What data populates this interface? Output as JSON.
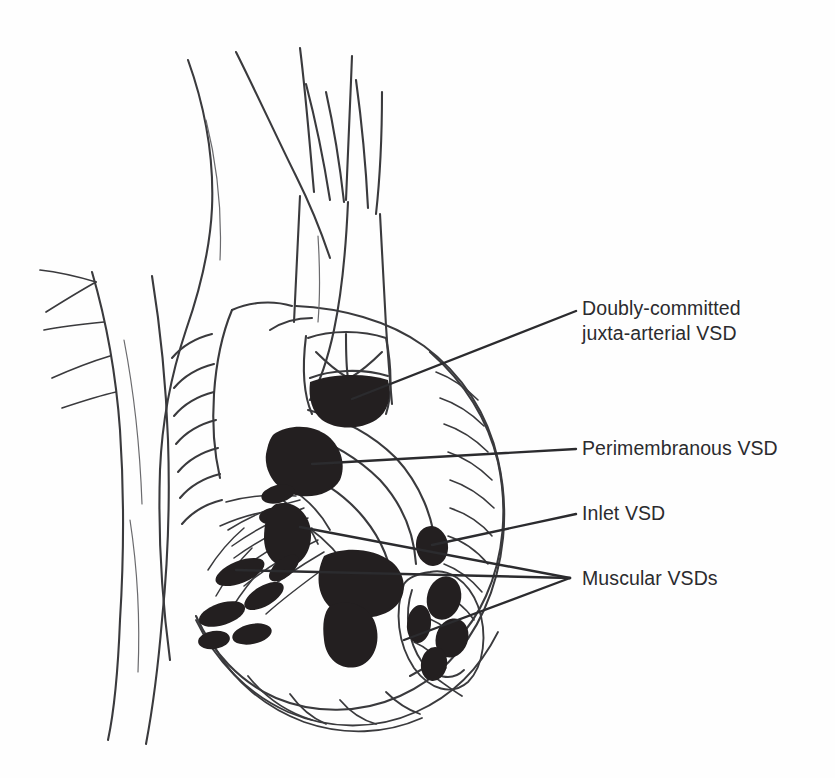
{
  "figure": {
    "background_color": "#fefefe",
    "ink_color": "#2b2b2e",
    "defect_fill_color": "#231f20",
    "width": 835,
    "height": 778
  },
  "labels": {
    "doubly_committed": {
      "line1": "Doubly-committed",
      "line2": "juxta-arterial VSD"
    },
    "perimembranous": "Perimembranous VSD",
    "inlet": "Inlet VSD",
    "muscular": "Muscular VSDs"
  },
  "leader_lines": [
    {
      "name": "doubly-committed-leader",
      "from_x": 576,
      "from_y": 311,
      "to_x": 352,
      "to_y": 399
    },
    {
      "name": "perimembranous-leader",
      "from_x": 576,
      "from_y": 449,
      "to_x": 312,
      "to_y": 464
    },
    {
      "name": "inlet-leader",
      "from_x": 576,
      "from_y": 514,
      "to_x": 432,
      "to_y": 545
    },
    {
      "name": "muscular-leader-upper",
      "from_x": 570,
      "from_y": 578,
      "to_x": 300,
      "to_y": 527
    },
    {
      "name": "muscular-leader-middle",
      "from_x": 570,
      "from_y": 578,
      "to_x": 236,
      "to_y": 570
    },
    {
      "name": "muscular-leader-lower",
      "from_x": 570,
      "from_y": 578,
      "to_x": 404,
      "to_y": 640
    }
  ],
  "structures": [
    {
      "name": "aortic-arch",
      "kind": "vessel"
    },
    {
      "name": "brachiocephalic-artery",
      "kind": "vessel"
    },
    {
      "name": "left-common-carotid-artery",
      "kind": "vessel"
    },
    {
      "name": "left-subclavian-artery",
      "kind": "vessel"
    },
    {
      "name": "descending-aorta",
      "kind": "vessel"
    },
    {
      "name": "intercostal-branches",
      "kind": "vessel"
    },
    {
      "name": "pulmonary-trunk",
      "kind": "vessel"
    },
    {
      "name": "right-atrium",
      "kind": "chamber"
    },
    {
      "name": "right-ventricle",
      "kind": "chamber"
    },
    {
      "name": "ventricular-septum",
      "kind": "septum"
    },
    {
      "name": "semilunar-valve-cusps",
      "kind": "valve"
    },
    {
      "name": "tricuspid-valve-leaflets",
      "kind": "valve"
    },
    {
      "name": "chordae-tendineae",
      "kind": "valve-apparatus"
    },
    {
      "name": "trabeculated-myocardium",
      "kind": "muscle"
    },
    {
      "name": "ventricular-apex",
      "kind": "muscle"
    }
  ],
  "defects": [
    {
      "name": "defect-doubly-committed-juxta-arterial",
      "type": "doubly-committed",
      "shape": "crescent",
      "cx": 352,
      "cy": 400
    },
    {
      "name": "defect-perimembranous",
      "type": "perimembranous",
      "shape": "blob",
      "cx": 308,
      "cy": 464
    },
    {
      "name": "defect-inlet",
      "type": "inlet",
      "shape": "oval",
      "cx": 432,
      "cy": 546
    },
    {
      "name": "defect-muscular-central",
      "type": "muscular",
      "shape": "blob",
      "cx": 360,
      "cy": 580
    },
    {
      "name": "defect-muscular-upper-septal",
      "type": "muscular",
      "shape": "blob",
      "cx": 292,
      "cy": 527
    },
    {
      "name": "defect-muscular-trabecular-1",
      "type": "muscular",
      "shape": "blob",
      "cx": 238,
      "cy": 572
    },
    {
      "name": "defect-muscular-trabecular-2",
      "type": "muscular",
      "shape": "blob",
      "cx": 222,
      "cy": 612
    },
    {
      "name": "defect-muscular-trabecular-3",
      "type": "muscular",
      "shape": "blob",
      "cx": 262,
      "cy": 596
    },
    {
      "name": "defect-muscular-apical",
      "type": "muscular",
      "shape": "blob",
      "cx": 352,
      "cy": 630
    },
    {
      "name": "defect-muscular-cluster-a",
      "type": "muscular",
      "shape": "blob",
      "cx": 442,
      "cy": 600
    },
    {
      "name": "defect-muscular-cluster-b",
      "type": "muscular",
      "shape": "blob",
      "cx": 420,
      "cy": 625
    },
    {
      "name": "defect-muscular-cluster-c",
      "type": "muscular",
      "shape": "blob",
      "cx": 450,
      "cy": 640
    },
    {
      "name": "defect-muscular-cluster-d",
      "type": "muscular",
      "shape": "blob",
      "cx": 432,
      "cy": 662
    }
  ]
}
